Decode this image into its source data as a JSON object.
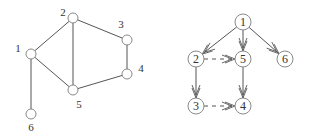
{
  "colors": {
    "stroke": "#555555",
    "node_fill": "#ffffff",
    "node_stroke": "#8a8a8a",
    "label": "#333333"
  },
  "undirected_graph": {
    "node_radius": 5,
    "nodes": [
      {
        "id": "1",
        "label": "1",
        "x": 31,
        "y": 54,
        "lx": 18,
        "ly": 52
      },
      {
        "id": "2",
        "label": "2",
        "x": 73,
        "y": 18,
        "lx": 63,
        "ly": 16
      },
      {
        "id": "3",
        "label": "3",
        "x": 127,
        "y": 40,
        "lx": 121,
        "ly": 28
      },
      {
        "id": "4",
        "label": "4",
        "x": 127,
        "y": 74,
        "lx": 141,
        "ly": 72
      },
      {
        "id": "5",
        "label": "5",
        "x": 73,
        "y": 90,
        "lx": 79,
        "ly": 108
      },
      {
        "id": "6",
        "label": "6",
        "x": 31,
        "y": 114,
        "lx": 31,
        "ly": 131
      }
    ],
    "edges": [
      {
        "from": "1",
        "to": "2"
      },
      {
        "from": "1",
        "to": "5"
      },
      {
        "from": "1",
        "to": "6"
      },
      {
        "from": "2",
        "to": "3"
      },
      {
        "from": "2",
        "to": "5"
      },
      {
        "from": "3",
        "to": "4"
      },
      {
        "from": "4",
        "to": "5"
      }
    ]
  },
  "directed_graph": {
    "node_radius": 8,
    "nodes": [
      {
        "id": "1",
        "label": "1",
        "x": 243,
        "y": 22
      },
      {
        "id": "2",
        "label": "2",
        "x": 196,
        "y": 59
      },
      {
        "id": "5",
        "label": "5",
        "x": 243,
        "y": 59
      },
      {
        "id": "6",
        "label": "6",
        "x": 285,
        "y": 59
      },
      {
        "id": "3",
        "label": "3",
        "x": 196,
        "y": 106
      },
      {
        "id": "4",
        "label": "4",
        "x": 243,
        "y": 106
      }
    ],
    "edges": [
      {
        "from": "1",
        "to": "2",
        "style": "solid"
      },
      {
        "from": "1",
        "to": "5",
        "style": "solid"
      },
      {
        "from": "1",
        "to": "6",
        "style": "solid"
      },
      {
        "from": "2",
        "to": "3",
        "style": "solid"
      },
      {
        "from": "5",
        "to": "4",
        "style": "solid"
      },
      {
        "from": "2",
        "to": "5",
        "style": "dashed"
      },
      {
        "from": "3",
        "to": "4",
        "style": "dashed"
      }
    ]
  }
}
